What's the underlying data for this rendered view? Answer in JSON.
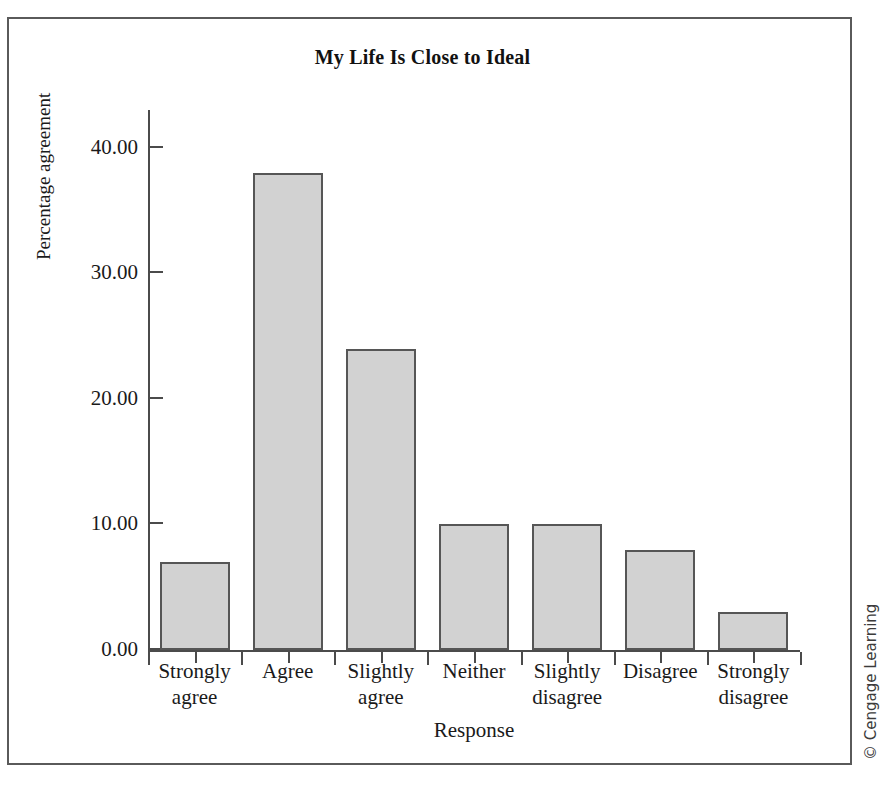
{
  "figure": {
    "copyright": "© Cengage Learning"
  },
  "chart_data": {
    "type": "bar",
    "title": "My Life Is Close to Ideal",
    "xlabel": "Response",
    "ylabel": "Percentage agreement",
    "categories": [
      "Strongly agree",
      "Agree",
      "Slightly agree",
      "Neither",
      "Slightly disagree",
      "Disagree",
      "Strongly disagree"
    ],
    "category_lines": [
      [
        "Strongly",
        "agree"
      ],
      [
        "Agree",
        ""
      ],
      [
        "Slightly",
        "agree"
      ],
      [
        "Neither",
        ""
      ],
      [
        "Slightly",
        "disagree"
      ],
      [
        "Disagree",
        ""
      ],
      [
        "Strongly",
        "disagree"
      ]
    ],
    "values": [
      7,
      38,
      24,
      10,
      10,
      8,
      3
    ],
    "ylim": [
      0,
      43
    ],
    "yticks": [
      0,
      10,
      20,
      30,
      40
    ],
    "ytick_labels": [
      "0.00",
      "10.00",
      "20.00",
      "30.00",
      "40.00"
    ],
    "grid": false,
    "legend": "none",
    "bar_fill_color": "#d2d2d2",
    "bar_border_color": "#565656",
    "axis_color": "#4b4b4b",
    "text_color": "#1a1a1a"
  }
}
